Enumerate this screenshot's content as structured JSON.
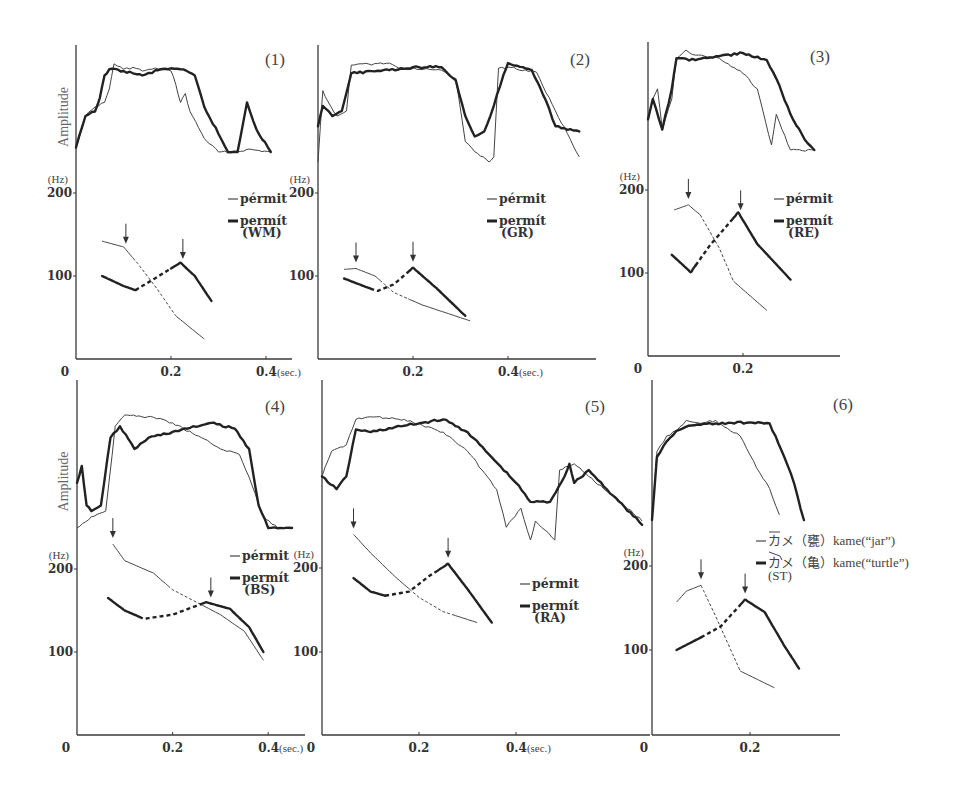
{
  "chart_data": [
    {
      "type": "line",
      "panel": "(1)",
      "speaker": "WM",
      "amplitude_label": "Amplitude",
      "ylabel": "(Hz)",
      "xlabel": "(sec.)",
      "x_ticks": [
        "0",
        "0.2",
        "0.4(sec.)"
      ],
      "y_ticks": [
        "200",
        "100"
      ],
      "legend": [
        {
          "style": "thin",
          "label": "pérmit"
        },
        {
          "style": "thick",
          "label": "permít",
          "sub": "(WM)"
        }
      ],
      "pitch_series": [
        {
          "name": "pérmit",
          "style": "thin",
          "x": [
            0.055,
            0.1,
            0.13,
            0.17,
            0.21,
            0.27
          ],
          "y": [
            142,
            135,
            115,
            85,
            52,
            24
          ],
          "dashed_range": [
            0.12,
            0.21
          ],
          "arrow_at": 0.105
        },
        {
          "name": "permít",
          "style": "thick",
          "x": [
            0.055,
            0.1,
            0.125,
            0.16,
            0.22,
            0.25,
            0.285
          ],
          "y": [
            100,
            88,
            83,
            95,
            116,
            100,
            70
          ],
          "dashed_range": [
            0.125,
            0.2
          ],
          "arrow_at": 0.225
        }
      ],
      "amplitude_series": [
        {
          "name": "pérmit",
          "style": "thin",
          "x": [
            0,
            0.02,
            0.04,
            0.06,
            0.07,
            0.08,
            0.1,
            0.12,
            0.14,
            0.16,
            0.18,
            0.2,
            0.21,
            0.22,
            0.23,
            0.24,
            0.27,
            0.3,
            0.34,
            0.36,
            0.41
          ],
          "y": [
            0.05,
            0.4,
            0.5,
            0.55,
            0.7,
            0.98,
            0.92,
            0.94,
            0.9,
            0.92,
            0.93,
            0.9,
            0.75,
            0.55,
            0.65,
            0.45,
            0.15,
            0.0,
            0.0,
            0.03,
            0.0
          ]
        },
        {
          "name": "permít",
          "style": "thick",
          "x": [
            0,
            0.02,
            0.04,
            0.05,
            0.06,
            0.07,
            0.1,
            0.14,
            0.18,
            0.2,
            0.22,
            0.25,
            0.27,
            0.3,
            0.32,
            0.34,
            0.36,
            0.38,
            0.41
          ],
          "y": [
            0.05,
            0.4,
            0.45,
            0.6,
            0.85,
            0.92,
            0.9,
            0.85,
            0.92,
            0.93,
            0.92,
            0.85,
            0.5,
            0.2,
            0.0,
            0.0,
            0.55,
            0.25,
            0.0
          ]
        }
      ]
    },
    {
      "type": "line",
      "panel": "(2)",
      "speaker": "GR",
      "ylabel": "(Hz)",
      "xlabel": "(sec.)",
      "x_ticks": [
        "0.2",
        "0.4(sec.)"
      ],
      "y_ticks": [
        "200",
        "100"
      ],
      "legend": [
        {
          "style": "thin",
          "label": "pérmit"
        },
        {
          "style": "thick",
          "label": "permít",
          "sub": "(GR)"
        }
      ],
      "pitch_series": [
        {
          "name": "pérmit",
          "style": "thin",
          "x": [
            0.055,
            0.08,
            0.12,
            0.16,
            0.22,
            0.32
          ],
          "y": [
            108,
            109,
            100,
            80,
            65,
            46
          ],
          "dashed_range": [
            0.13,
            0.19
          ],
          "arrow_at": 0.08
        },
        {
          "name": "permít",
          "style": "thick",
          "x": [
            0.055,
            0.1,
            0.125,
            0.16,
            0.2,
            0.25,
            0.31
          ],
          "y": [
            97,
            87,
            82,
            90,
            110,
            85,
            52
          ],
          "dashed_range": [
            0.11,
            0.19
          ],
          "arrow_at": 0.2
        }
      ],
      "amplitude_series": [
        {
          "name": "pérmit",
          "style": "thin",
          "x": [
            0,
            0.01,
            0.02,
            0.04,
            0.06,
            0.07,
            0.15,
            0.17,
            0.26,
            0.29,
            0.31,
            0.33,
            0.36,
            0.37,
            0.38,
            0.4,
            0.46,
            0.5,
            0.55
          ],
          "y": [
            0.0,
            0.7,
            0.6,
            0.45,
            0.5,
            0.95,
            0.97,
            0.92,
            0.9,
            0.82,
            0.2,
            0.1,
            0.0,
            0.05,
            0.92,
            0.93,
            0.88,
            0.5,
            0.05
          ]
        },
        {
          "name": "permít",
          "style": "thick",
          "x": [
            0,
            0.01,
            0.03,
            0.05,
            0.07,
            0.15,
            0.2,
            0.26,
            0.29,
            0.31,
            0.33,
            0.35,
            0.37,
            0.39,
            0.4,
            0.45,
            0.48,
            0.5,
            0.55
          ],
          "y": [
            0.35,
            0.55,
            0.45,
            0.5,
            0.87,
            0.9,
            0.93,
            0.93,
            0.8,
            0.45,
            0.25,
            0.3,
            0.55,
            0.85,
            0.97,
            0.9,
            0.6,
            0.35,
            0.3
          ]
        }
      ]
    },
    {
      "type": "line",
      "panel": "(3)",
      "speaker": "RE",
      "ylabel": "(Hz)",
      "x_ticks": [
        "0",
        "0.2"
      ],
      "y_ticks": [
        "200",
        "100"
      ],
      "legend": [
        {
          "style": "thin",
          "label": "pérmit"
        },
        {
          "style": "thick",
          "label": "permít",
          "sub": "(RE)"
        }
      ],
      "pitch_series": [
        {
          "name": "pérmit",
          "style": "thin",
          "x": [
            0.055,
            0.085,
            0.11,
            0.15,
            0.18,
            0.25
          ],
          "y": [
            176,
            182,
            170,
            130,
            90,
            55
          ],
          "dashed_range": [
            0.11,
            0.18
          ],
          "arrow_at": 0.085
        },
        {
          "name": "permít",
          "style": "thick",
          "x": [
            0.05,
            0.09,
            0.13,
            0.19,
            0.23,
            0.3
          ],
          "y": [
            122,
            101,
            133,
            173,
            135,
            92
          ],
          "dashed_range": [
            0.1,
            0.18
          ],
          "arrow_at": 0.195
        }
      ],
      "amplitude_series": [
        {
          "name": "pérmit",
          "style": "thin",
          "x": [
            0,
            0.01,
            0.02,
            0.03,
            0.05,
            0.06,
            0.08,
            0.1,
            0.15,
            0.2,
            0.23,
            0.26,
            0.27,
            0.3,
            0.35
          ],
          "y": [
            0.3,
            0.5,
            0.6,
            0.2,
            0.5,
            0.9,
            0.98,
            0.93,
            0.9,
            0.75,
            0.6,
            0.05,
            0.35,
            0.0,
            0.0
          ]
        },
        {
          "name": "permít",
          "style": "thick",
          "x": [
            0,
            0.01,
            0.03,
            0.05,
            0.06,
            0.1,
            0.15,
            0.2,
            0.25,
            0.27,
            0.3,
            0.33,
            0.35
          ],
          "y": [
            0.3,
            0.5,
            0.2,
            0.6,
            0.9,
            0.88,
            0.92,
            0.95,
            0.88,
            0.7,
            0.35,
            0.1,
            0.0
          ]
        }
      ]
    },
    {
      "type": "line",
      "panel": "(4)",
      "speaker": "BS",
      "amplitude_label": "Amplitude",
      "ylabel": "(Hz)",
      "x_ticks": [
        "0",
        "0.2",
        "0.4(sec.)"
      ],
      "y_ticks": [
        "200",
        "100"
      ],
      "legend": [
        {
          "style": "thin",
          "label": "pérmit"
        },
        {
          "style": "thick",
          "label": "permít",
          "sub": "(BS)"
        }
      ],
      "pitch_series": [
        {
          "name": "pérmit",
          "style": "thin",
          "x": [
            0.075,
            0.1,
            0.16,
            0.2,
            0.25,
            0.3,
            0.35,
            0.39
          ],
          "y": [
            230,
            210,
            195,
            175,
            160,
            145,
            125,
            90
          ],
          "dashed_range": [
            0.19,
            0.26
          ],
          "arrow_at": 0.075
        },
        {
          "name": "permít",
          "style": "thick",
          "x": [
            0.065,
            0.1,
            0.14,
            0.2,
            0.27,
            0.32,
            0.36,
            0.39
          ],
          "y": [
            165,
            150,
            140,
            145,
            160,
            152,
            130,
            100
          ],
          "dashed_range": [
            0.13,
            0.26
          ],
          "arrow_at": 0.28
        }
      ],
      "amplitude_series": [
        {
          "name": "pérmit",
          "style": "thin",
          "x": [
            0,
            0.03,
            0.06,
            0.08,
            0.1,
            0.16,
            0.2,
            0.26,
            0.3,
            0.34,
            0.36,
            0.39,
            0.42,
            0.45
          ],
          "y": [
            0.0,
            0.1,
            0.15,
            0.9,
            1.0,
            0.98,
            0.93,
            0.8,
            0.7,
            0.65,
            0.45,
            0.1,
            0.0,
            0.0
          ]
        },
        {
          "name": "permít",
          "style": "thick",
          "x": [
            0,
            0.01,
            0.02,
            0.03,
            0.05,
            0.07,
            0.09,
            0.12,
            0.15,
            0.2,
            0.28,
            0.33,
            0.36,
            0.38,
            0.4,
            0.45
          ],
          "y": [
            0.4,
            0.55,
            0.2,
            0.15,
            0.2,
            0.8,
            0.9,
            0.7,
            0.8,
            0.85,
            0.93,
            0.88,
            0.7,
            0.2,
            0.0,
            0.0
          ]
        }
      ]
    },
    {
      "type": "line",
      "panel": "(5)",
      "speaker": "RA",
      "ylabel": "(Hz)",
      "x_ticks": [
        "0",
        "0.2",
        "0.4(sec.)"
      ],
      "y_ticks": [
        "200",
        "100"
      ],
      "legend": [
        {
          "style": "thin",
          "label": "pérmit"
        },
        {
          "style": "thick",
          "label": "permít",
          "sub": "(RA)"
        }
      ],
      "pitch_series": [
        {
          "name": "pérmit",
          "style": "thin",
          "x": [
            0.065,
            0.1,
            0.15,
            0.2,
            0.25,
            0.32
          ],
          "y": [
            240,
            218,
            190,
            165,
            148,
            135
          ],
          "dashed_range": [
            0.18,
            0.27
          ],
          "arrow_at": 0.065
        },
        {
          "name": "permít",
          "style": "thick",
          "x": [
            0.065,
            0.1,
            0.13,
            0.18,
            0.22,
            0.26,
            0.3,
            0.35
          ],
          "y": [
            188,
            172,
            167,
            172,
            190,
            205,
            175,
            135
          ],
          "dashed_range": [
            0.13,
            0.24
          ],
          "arrow_at": 0.26
        }
      ],
      "amplitude_series": [
        {
          "name": "pérmit",
          "style": "thin",
          "x": [
            0,
            0.02,
            0.05,
            0.07,
            0.1,
            0.17,
            0.25,
            0.3,
            0.33,
            0.36,
            0.38,
            0.41,
            0.43,
            0.44,
            0.48,
            0.49,
            0.52,
            0.55,
            0.6,
            0.66
          ],
          "y": [
            0.5,
            0.7,
            0.75,
            0.95,
            0.97,
            0.95,
            0.85,
            0.7,
            0.55,
            0.4,
            0.1,
            0.25,
            0.0,
            0.15,
            0.0,
            0.55,
            0.6,
            0.5,
            0.35,
            0.15
          ]
        },
        {
          "name": "permít",
          "style": "thick",
          "x": [
            0,
            0.03,
            0.05,
            0.07,
            0.1,
            0.17,
            0.25,
            0.3,
            0.35,
            0.4,
            0.43,
            0.47,
            0.5,
            0.51,
            0.52,
            0.55,
            0.6,
            0.66
          ],
          "y": [
            0.5,
            0.4,
            0.5,
            0.87,
            0.85,
            0.9,
            0.95,
            0.85,
            0.65,
            0.45,
            0.3,
            0.3,
            0.5,
            0.6,
            0.45,
            0.55,
            0.35,
            0.12
          ]
        }
      ]
    },
    {
      "type": "line",
      "panel": "(6)",
      "speaker": "ST",
      "ylabel": "(Hz)",
      "x_ticks": [
        "0",
        "0.2"
      ],
      "y_ticks": [
        "200",
        "100"
      ],
      "legend": [
        {
          "style": "thin",
          "label": "カメ（甕）kame(“jar”)",
          "accent": "overline"
        },
        {
          "style": "thick",
          "label": "カメ（亀）kame(“turtle”)",
          "accent": "falling",
          "sub": "(ST)"
        }
      ],
      "pitch_series": [
        {
          "name": "kame (jar)",
          "style": "thin",
          "x": [
            0.05,
            0.07,
            0.1,
            0.13,
            0.18,
            0.25
          ],
          "y": [
            157,
            170,
            177,
            140,
            75,
            55
          ],
          "dashed_range": [
            0.1,
            0.18
          ],
          "arrow_at": 0.1
        },
        {
          "name": "kame (turtle)",
          "style": "thick",
          "x": [
            0.05,
            0.1,
            0.14,
            0.19,
            0.23,
            0.27,
            0.3
          ],
          "y": [
            100,
            115,
            128,
            160,
            145,
            105,
            78
          ],
          "dashed_range": [
            0.1,
            0.18
          ],
          "arrow_at": 0.19
        }
      ],
      "amplitude_series": [
        {
          "name": "kame (jar)",
          "style": "thin",
          "x": [
            0,
            0.01,
            0.03,
            0.05,
            0.07,
            0.1,
            0.13,
            0.16,
            0.18,
            0.2,
            0.22,
            0.24,
            0.26
          ],
          "y": [
            0.0,
            0.65,
            0.8,
            0.85,
            0.95,
            0.92,
            0.95,
            0.85,
            0.8,
            0.62,
            0.45,
            0.3,
            0.05
          ]
        },
        {
          "name": "kame (turtle)",
          "style": "thick",
          "x": [
            0,
            0.01,
            0.03,
            0.05,
            0.08,
            0.13,
            0.2,
            0.24,
            0.27,
            0.29,
            0.31
          ],
          "y": [
            0.0,
            0.6,
            0.75,
            0.85,
            0.9,
            0.92,
            0.93,
            0.92,
            0.6,
            0.35,
            0.0
          ]
        }
      ]
    }
  ]
}
